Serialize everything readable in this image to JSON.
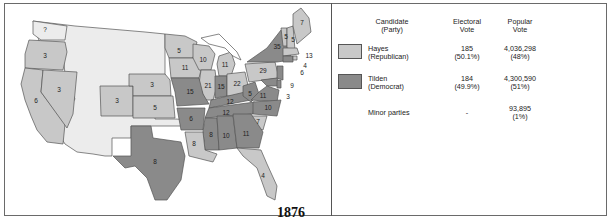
{
  "map": {
    "year": "1876",
    "colors": {
      "republican": "#c8c8c8",
      "democrat": "#8a8a8a",
      "territory": "#ececec",
      "water": "#ffffff",
      "border": "#555555"
    },
    "states": [
      {
        "name": "Washington",
        "party": "territory",
        "ev": "?"
      },
      {
        "name": "Oregon",
        "party": "republican",
        "ev": "3"
      },
      {
        "name": "California",
        "party": "republican",
        "ev": "6"
      },
      {
        "name": "Nevada",
        "party": "republican",
        "ev": "3"
      },
      {
        "name": "Colorado",
        "party": "republican",
        "ev": "3"
      },
      {
        "name": "Nebraska",
        "party": "republican",
        "ev": "3"
      },
      {
        "name": "Kansas",
        "party": "republican",
        "ev": "5"
      },
      {
        "name": "Minnesota",
        "party": "republican",
        "ev": "5"
      },
      {
        "name": "Iowa",
        "party": "republican",
        "ev": "11"
      },
      {
        "name": "Wisconsin",
        "party": "republican",
        "ev": "10"
      },
      {
        "name": "Michigan",
        "party": "republican",
        "ev": "11"
      },
      {
        "name": "Illinois",
        "party": "republican",
        "ev": "21"
      },
      {
        "name": "Ohio",
        "party": "republican",
        "ev": "22"
      },
      {
        "name": "Pennsylvania",
        "party": "republican",
        "ev": "29"
      },
      {
        "name": "New York",
        "party": "democrat",
        "ev": "35"
      },
      {
        "name": "Vermont",
        "party": "republican",
        "ev": "5"
      },
      {
        "name": "New Hampshire",
        "party": "republican",
        "ev": "5"
      },
      {
        "name": "Maine",
        "party": "republican",
        "ev": "7"
      },
      {
        "name": "Massachusetts",
        "party": "republican",
        "ev": "13"
      },
      {
        "name": "Rhode Island",
        "party": "republican",
        "ev": "4"
      },
      {
        "name": "Connecticut",
        "party": "democrat",
        "ev": "6"
      },
      {
        "name": "New Jersey",
        "party": "democrat",
        "ev": "9"
      },
      {
        "name": "Delaware",
        "party": "democrat",
        "ev": "3"
      },
      {
        "name": "Maryland",
        "party": "democrat",
        "ev": "8"
      },
      {
        "name": "Missouri",
        "party": "democrat",
        "ev": "15"
      },
      {
        "name": "Indiana",
        "party": "democrat",
        "ev": "15"
      },
      {
        "name": "West Virginia",
        "party": "democrat",
        "ev": "5"
      },
      {
        "name": "Virginia",
        "party": "democrat",
        "ev": "11"
      },
      {
        "name": "Kentucky",
        "party": "democrat",
        "ev": "12"
      },
      {
        "name": "Tennessee",
        "party": "democrat",
        "ev": "12"
      },
      {
        "name": "North Carolina",
        "party": "democrat",
        "ev": "10"
      },
      {
        "name": "South Carolina",
        "party": "republican",
        "ev": "7"
      },
      {
        "name": "Arkansas",
        "party": "democrat",
        "ev": "6"
      },
      {
        "name": "Mississippi",
        "party": "democrat",
        "ev": "8"
      },
      {
        "name": "Alabama",
        "party": "democrat",
        "ev": "10"
      },
      {
        "name": "Georgia",
        "party": "democrat",
        "ev": "11"
      },
      {
        "name": "Louisiana",
        "party": "republican",
        "ev": "8"
      },
      {
        "name": "Florida",
        "party": "republican",
        "ev": "4"
      },
      {
        "name": "Texas",
        "party": "democrat",
        "ev": "8"
      }
    ]
  },
  "legend": {
    "headers": {
      "candidate_line1": "Candidate",
      "candidate_line2": "(Party)",
      "electoral_line1": "Electoral",
      "electoral_line2": "Vote",
      "popular_line1": "Popular",
      "popular_line2": "Vote"
    },
    "rows": [
      {
        "name": "Hayes",
        "party": "(Republican)",
        "electoral": "185",
        "electoral_pct": "(50.1%)",
        "popular": "4,036,298",
        "popular_pct": "(48%)",
        "color": "#c8c8c8"
      },
      {
        "name": "Tilden",
        "party": "(Democrat)",
        "electoral": "184",
        "electoral_pct": "(49.9%)",
        "popular": "4,300,590",
        "popular_pct": "(51%)",
        "color": "#8a8a8a"
      },
      {
        "name": "Minor parties",
        "party": "",
        "electoral": "-",
        "electoral_pct": "",
        "popular": "93,895",
        "popular_pct": "(1%)"
      }
    ]
  }
}
